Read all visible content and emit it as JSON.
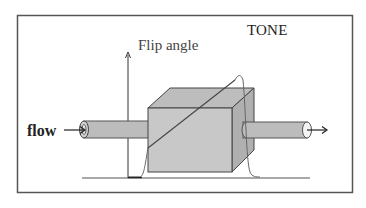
{
  "diagram": {
    "title": "TONE",
    "axis_label": "Flip angle",
    "flow_label": "flow",
    "colors": {
      "frame": "#555555",
      "cube_front": "#c8c8c8",
      "cube_top": "#bdbdbd",
      "cube_side": "#b2b2b2",
      "pipe": "#bcbcbc",
      "lines": "#333333",
      "profile": "#666666"
    },
    "elements": [
      "frame",
      "title-label",
      "flip-angle-axis",
      "flip-angle-label",
      "baseline",
      "left-pipe",
      "cube",
      "right-pipe",
      "ramp-line",
      "slab-profile-curve",
      "flow-label",
      "inflow-arrow",
      "outflow-arrow"
    ]
  }
}
